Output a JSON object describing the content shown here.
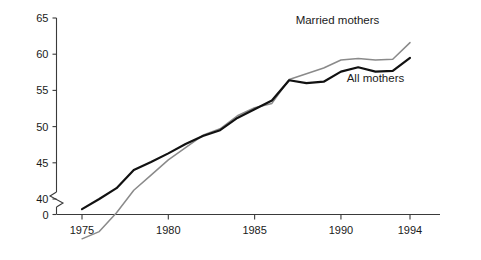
{
  "chart_data": {
    "type": "line",
    "title": "",
    "subtitle": "",
    "xlabel": "",
    "ylabel": "",
    "x": [
      1975,
      1976,
      1977,
      1978,
      1979,
      1980,
      1981,
      1982,
      1983,
      1984,
      1985,
      1986,
      1987,
      1988,
      1989,
      1990,
      1991,
      1992,
      1993,
      1994
    ],
    "xlim": [
      1974,
      1995.5
    ],
    "ylim": [
      40,
      65
    ],
    "y_axis_break": true,
    "y_break_from": 0,
    "y_break_to": 40,
    "grid": false,
    "legend_position": "inline-annotations",
    "x_ticks": [
      1975,
      1980,
      1985,
      1990,
      1994
    ],
    "x_tick_labels": [
      "1975",
      "1980",
      "1985",
      "1990",
      "1994"
    ],
    "y_ticks": [
      0,
      40,
      45,
      50,
      55,
      60,
      65
    ],
    "y_tick_labels": [
      "0",
      "40",
      "45",
      "50",
      "55",
      "60",
      "65"
    ],
    "series": [
      {
        "name": "All mothers",
        "color": "#111111",
        "label_x": 1992.0,
        "label_y": 56.2,
        "values": [
          38.6,
          40.0,
          41.5,
          44.0,
          45.1,
          46.3,
          47.6,
          48.7,
          49.5,
          51.2,
          52.4,
          53.6,
          56.4,
          56.0,
          56.2,
          57.6,
          58.2,
          57.6,
          57.7,
          59.5
        ]
      },
      {
        "name": "Married mothers",
        "color": "#8a8a8a",
        "label_x": 1989.8,
        "label_y": 64.2,
        "values": [
          34.5,
          35.5,
          38.1,
          41.2,
          43.3,
          45.4,
          47.1,
          48.8,
          49.7,
          51.5,
          52.6,
          53.2,
          56.5,
          57.3,
          58.1,
          59.2,
          59.4,
          59.2,
          59.3,
          61.6
        ]
      }
    ],
    "annotations": [
      {
        "text": "Married mothers",
        "name": "married-mothers-label"
      },
      {
        "text": "All mothers",
        "name": "all-mothers-label"
      }
    ]
  },
  "colors": {
    "axis": "#3a3a3a",
    "all_mothers": "#111111",
    "married_mothers": "#8a8a8a",
    "background": "#ffffff",
    "text": "#1a1a1a"
  }
}
